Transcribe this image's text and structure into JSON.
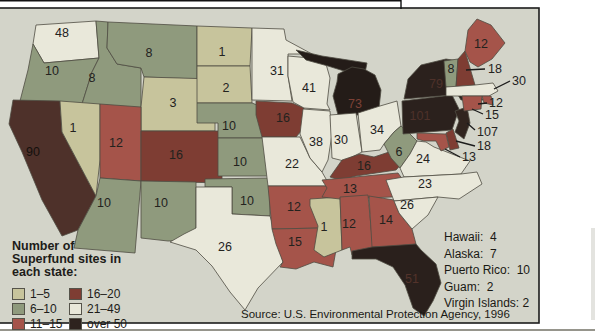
{
  "frame": {
    "box_fill": "#d3d4c9",
    "box_border": "#1c1c1c",
    "state_border": "#4f4c42",
    "rule_color": "#96958c",
    "top_line_color": "#111111",
    "label_color": "#23221e"
  },
  "palette": {
    "cat1": "#c7c49c",
    "cat2": "#8f9a7d",
    "cat3": "#a5544a",
    "cat4": "#7e3d33",
    "cat5": "#e9e8da",
    "cat6": "#2e231e"
  },
  "legend": {
    "title": "Number of Superfund sites in each state:",
    "items": [
      {
        "label": "1–5",
        "cat": "cat1"
      },
      {
        "label": "6–10",
        "cat": "cat2"
      },
      {
        "label": "11–15",
        "cat": "cat3"
      },
      {
        "label": "16–20",
        "cat": "cat4"
      },
      {
        "label": "21–49",
        "cat": "cat5"
      },
      {
        "label": "over 50",
        "cat": "cat6"
      }
    ]
  },
  "territories": [
    "Hawaii:  4",
    "Alaska:  7",
    "Puerto Rico:  10",
    "Guam:  2",
    "Virgin Islands: 2"
  ],
  "source": "Source: U.S. Environmental Protection Agency, 1996",
  "map": {
    "states": [
      {
        "id": "WA",
        "value": "48",
        "cat": "cat5",
        "lx": 62,
        "ly": 37,
        "path": "M36,25 L96,21 L99,58 L44,63 L33,44 Z"
      },
      {
        "id": "OR",
        "value": "10",
        "cat": "cat2",
        "lx": 52,
        "ly": 75,
        "path": "M33,44 L44,63 L99,58 L92,72 L82,104 L20,101 L28,70 Z"
      },
      {
        "id": "ID",
        "value": "8",
        "cat": "cat2",
        "lx": 92,
        "ly": 82,
        "path": "M96,21 L108,22 L107,48 L117,64 L141,68 L141,109 L82,104 L92,72 L99,58 Z"
      },
      {
        "id": "MT",
        "value": "8",
        "cat": "cat2",
        "lx": 149,
        "ly": 57,
        "path": "M108,22 L197,26 L197,79 L144,77 L141,68 L117,64 L107,48 Z"
      },
      {
        "id": "WY",
        "value": "3",
        "cat": "cat1",
        "lx": 173,
        "ly": 107,
        "path": "M144,77 L215,79 L215,131 L141,131 L141,107 Z"
      },
      {
        "id": "CA",
        "value": "90",
        "cat": "cat6",
        "fill": "#4e312a",
        "num_color": "#14100d",
        "lx": 33,
        "ly": 156,
        "path": "M13,100 L60,101 L62,132 L96,196 L78,230 L62,236 L42,200 L22,152 L9,124 Z"
      },
      {
        "id": "NV",
        "value": "1",
        "cat": "cat1",
        "lx": 73,
        "ly": 132,
        "path": "M60,101 L100,104 L100,160 L96,196 L62,132 Z"
      },
      {
        "id": "UT",
        "value": "12",
        "cat": "cat3",
        "lx": 116,
        "ly": 147,
        "path": "M100,104 L141,107 L141,181 L100,178 Z"
      },
      {
        "id": "CO",
        "value": "16",
        "cat": "cat4",
        "lx": 176,
        "ly": 159,
        "path": "M141,131 L222,131 L222,183 L141,181 Z"
      },
      {
        "id": "AZ",
        "value": "10",
        "cat": "cat2",
        "lx": 104,
        "ly": 207,
        "path": "M100,178 L141,181 L135,253 L74,248 L78,230 L96,196 Z"
      },
      {
        "id": "NM",
        "value": "10",
        "cat": "cat2",
        "lx": 161,
        "ly": 207,
        "path": "M141,181 L196,182 L196,240 L168,241 L141,238 Z"
      },
      {
        "id": "ND",
        "value": "1",
        "cat": "cat1",
        "lx": 222,
        "ly": 56,
        "path": "M197,26 L252,28 L250,66 L197,66 Z"
      },
      {
        "id": "SD",
        "value": "2",
        "cat": "cat1",
        "lx": 226,
        "ly": 92,
        "path": "M197,66 L250,66 L252,103 L197,103 Z"
      },
      {
        "id": "NE",
        "value": "10",
        "cat": "cat2",
        "lx": 229,
        "ly": 130,
        "path": "M197,103 L252,103 L262,107 L274,116 L278,126 L278,138 L218,138 L218,123 L197,123 Z"
      },
      {
        "id": "KS",
        "value": "10",
        "cat": "cat2",
        "lx": 240,
        "ly": 166,
        "path": "M218,138 L278,138 L278,176 L218,176 Z"
      },
      {
        "id": "OK",
        "value": "10",
        "cat": "cat2",
        "lx": 247,
        "ly": 205,
        "path": "M205,179 L270,178 L270,216 L232,214 L232,187 L205,187 Z"
      },
      {
        "id": "TX",
        "value": "26",
        "cat": "cat5",
        "lx": 225,
        "ly": 251,
        "path": "M196,187 L232,187 L232,214 L270,216 L274,229 L283,262 L258,288 L245,310 L230,292 L212,266 L196,250 L170,242 L184,234 L196,228 Z"
      },
      {
        "id": "MN",
        "value": "31",
        "cat": "cat5",
        "lx": 277,
        "ly": 75,
        "path": "M252,28 L284,29 L286,40 L312,54 L288,54 L288,76 L292,101 L252,100 Z"
      },
      {
        "id": "IA",
        "value": "16",
        "cat": "cat4",
        "lx": 283,
        "ly": 122,
        "path": "M256,101 L292,103 L304,108 L302,130 L296,137 L262,137 L256,115 Z"
      },
      {
        "id": "MO",
        "value": "22",
        "cat": "cat5",
        "lx": 292,
        "ly": 168,
        "path": "M262,137 L300,137 L310,158 L322,172 L330,186 L268,186 Z"
      },
      {
        "id": "AR",
        "value": "12",
        "cat": "cat3",
        "lx": 294,
        "ly": 211,
        "path": "M268,186 L330,186 L322,228 L272,229 Z"
      },
      {
        "id": "LA",
        "value": "15",
        "cat": "cat3",
        "lx": 295,
        "ly": 246,
        "path": "M272,229 L322,228 L324,243 L336,250 L333,267 L314,262 L296,269 L280,267 L283,262 L276,244 Z"
      },
      {
        "id": "WI",
        "value": "41",
        "cat": "cat5",
        "lx": 309,
        "ly": 92,
        "path": "M288,56 L310,58 L326,64 L330,78 L327,104 L330,110 L304,108 L293,102 L288,76 Z"
      },
      {
        "id": "IL",
        "value": "38",
        "cat": "cat5",
        "lx": 316,
        "ly": 146,
        "path": "M303,109 L330,111 L332,134 L328,160 L322,172 L310,158 L300,134 Z"
      },
      {
        "id": "MS",
        "value": "1",
        "cat": "cat1",
        "lx": 324,
        "ly": 231,
        "path": "M310,199 L340,197 L342,250 L324,257 L314,250 L318,226 L310,206 Z"
      },
      {
        "id": "MI-UP",
        "value": "",
        "cat": "cat6",
        "fill": "#241c18",
        "lx": 0,
        "ly": 0,
        "path": "M296,50 L322,56 L348,60 L367,63 L365,73 L344,71 L328,66 L306,60 Z"
      },
      {
        "id": "MI",
        "value": "73",
        "cat": "cat6",
        "fill": "#241c18",
        "num_color": "#7c4136",
        "lx": 355,
        "ly": 108,
        "path": "M338,74 L352,67 L364,69 L375,75 L381,90 L379,108 L372,115 L338,115 L333,96 L337,82 Z"
      },
      {
        "id": "IN",
        "value": "30",
        "cat": "cat5",
        "lx": 341,
        "ly": 144,
        "path": "M330,115 L356,113 L362,152 L344,161 L332,158 Z"
      },
      {
        "id": "OH",
        "value": "34",
        "cat": "cat5",
        "lx": 377,
        "ly": 134,
        "path": "M358,113 L380,106 L397,101 L401,126 L394,132 L384,144 L380,150 L362,152 Z"
      },
      {
        "id": "KY",
        "value": "16",
        "cat": "cat4",
        "lx": 364,
        "ly": 170,
        "path": "M330,177 L342,160 L360,154 L374,157 L398,149 L406,159 L396,170 L356,176 L340,180 Z"
      },
      {
        "id": "TN",
        "value": "13",
        "cat": "cat3",
        "lx": 350,
        "ly": 193,
        "path": "M322,180 L398,173 L403,180 L392,197 L340,199 L322,197 L327,188 Z"
      },
      {
        "id": "AL",
        "value": "12",
        "cat": "cat3",
        "lx": 349,
        "ly": 228,
        "path": "M340,197 L368,195 L373,248 L375,254 L352,255 L350,247 L342,250 Z"
      },
      {
        "id": "GA",
        "value": "14",
        "cat": "cat3",
        "lx": 386,
        "ly": 224,
        "path": "M369,196 L394,200 L399,213 L412,229 L416,244 L399,247 L372,247 Z"
      },
      {
        "id": "FL",
        "value": "51",
        "cat": "cat6",
        "fill": "#2a201c",
        "num_color": "#53332b",
        "lx": 412,
        "ly": 283,
        "path": "M352,251 L372,247 L416,244 L421,250 L436,264 L441,283 L433,301 L424,316 L413,308 L405,285 L393,267 L376,259 L352,259 Z"
      },
      {
        "id": "WV",
        "value": "6",
        "cat": "cat2",
        "lx": 399,
        "ly": 156,
        "path": "M384,144 L394,132 L401,126 L409,133 L417,141 L410,154 L400,168 L391,158 Z"
      },
      {
        "id": "VA",
        "value": "24",
        "cat": "cat5",
        "lx": 423,
        "ly": 163,
        "path": "M400,168 L410,154 L417,141 L426,142 L434,147 L470,161 L461,174 L404,177 Z"
      },
      {
        "id": "NC",
        "value": "23",
        "cat": "cat5",
        "lx": 425,
        "ly": 188,
        "path": "M386,180 L404,177 L461,174 L477,172 L482,184 L459,199 L438,197 L394,201 Z"
      },
      {
        "id": "SC",
        "value": "26",
        "cat": "cat5",
        "lx": 407,
        "ly": 209,
        "path": "M394,201 L438,197 L428,215 L412,229 L399,213 Z"
      },
      {
        "id": "PA",
        "value": "101",
        "cat": "cat6",
        "fill": "#2b211d",
        "num_color": "#4e312a",
        "lx": 420,
        "ly": 120,
        "path": "M402,101 L452,95 L459,109 L452,130 L403,134 Z"
      },
      {
        "id": "NY",
        "value": "79",
        "cat": "cat6",
        "fill": "#2b211d",
        "num_color": "#4e312a",
        "lx": 436,
        "ly": 88,
        "path": "M404,99 L408,79 L421,65 L446,59 L458,61 L455,76 L466,86 L457,94 L452,95 Z"
      },
      {
        "id": "NY-LI",
        "value": "",
        "cat": "cat6",
        "fill": "#2b211d",
        "lx": 0,
        "ly": 0,
        "path": "M458,95 L479,95 L483,100 L461,100 Z"
      },
      {
        "id": "NJ",
        "value": "",
        "cat": "cat6",
        "fill": "#31251f",
        "lx": 0,
        "ly": 0,
        "path": "M455,111 L467,107 L470,123 L464,139 L455,132 L459,121 Z"
      },
      {
        "id": "DE",
        "value": "",
        "cat": "cat4",
        "lx": 0,
        "ly": 0,
        "path": "M446,133 L453,129 L459,148 L450,150 Z"
      },
      {
        "id": "MD",
        "value": "",
        "cat": "cat3",
        "lx": 0,
        "ly": 0,
        "path": "M417,133 L446,134 L449,147 L441,151 L436,141 L424,141 L417,139 Z"
      },
      {
        "id": "VT",
        "value": "8",
        "cat": "cat2",
        "lx": 451,
        "ly": 73,
        "path": "M444,61 L458,59 L456,87 L446,87 Z"
      },
      {
        "id": "NH",
        "value": "",
        "cat": "cat4",
        "lx": 0,
        "ly": 0,
        "path": "M458,59 L465,51 L475,85 L456,87 Z"
      },
      {
        "id": "ME",
        "value": "12",
        "cat": "cat3",
        "lx": 481,
        "ly": 48,
        "path": "M465,51 L468,30 L477,19 L491,25 L505,43 L492,59 L478,67 L470,62 Z"
      },
      {
        "id": "MA",
        "value": "",
        "cat": "cat5",
        "lx": 0,
        "ly": 0,
        "path": "M446,87 L475,85 L493,83 L498,91 L489,96 L446,96 Z"
      },
      {
        "id": "RI",
        "value": "",
        "cat": "cat3",
        "lx": 0,
        "ly": 0,
        "path": "M482,96 L491,96 L493,105 L484,103 Z"
      },
      {
        "id": "CT",
        "value": "",
        "cat": "cat3",
        "lx": 0,
        "ly": 0,
        "path": "M462,96 L482,96 L481,109 L464,111 Z"
      }
    ],
    "callouts": [
      {
        "state": "NH",
        "value": "18",
        "x1": 466,
        "y1": 70,
        "x2": 485,
        "y2": 69,
        "tx": 488,
        "ty": 73
      },
      {
        "state": "MA",
        "value": "30",
        "x1": 494,
        "y1": 89,
        "x2": 510,
        "y2": 81,
        "tx": 512,
        "ty": 85
      },
      {
        "state": "RI",
        "value": "12",
        "x1": 478,
        "y1": 104,
        "x2": 487,
        "y2": 103,
        "tx": 489,
        "ty": 107
      },
      {
        "state": "CT",
        "value": "15",
        "x1": 472,
        "y1": 109,
        "x2": 483,
        "y2": 114,
        "tx": 485,
        "ty": 119
      },
      {
        "state": "NJ",
        "value": "107",
        "x1": 467,
        "y1": 123,
        "x2": 475,
        "y2": 130,
        "tx": 477,
        "ty": 136
      },
      {
        "state": "DE",
        "value": "18",
        "x1": 456,
        "y1": 141,
        "x2": 475,
        "y2": 146,
        "tx": 477,
        "ty": 150
      },
      {
        "state": "MD",
        "value": "13",
        "x1": 445,
        "y1": 149,
        "x2": 460,
        "y2": 157,
        "tx": 462,
        "ty": 161
      }
    ]
  }
}
